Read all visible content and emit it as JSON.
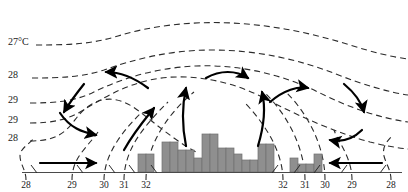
{
  "figure": {
    "type": "meteorological-cross-section",
    "background_color": "#ffffff",
    "isotherm": {
      "color": "#2b2b2b",
      "style": "dashed",
      "dash_pattern": "6 4",
      "width": 1.1
    },
    "arrow_color": "#000000",
    "bar_fill": "#8f8f8f",
    "bar_stroke": "#6f6f6f",
    "baseline_color": "#4a4a4a"
  },
  "left_labels": [
    {
      "text": "27°C",
      "x": 8,
      "y": 45
    },
    {
      "text": "28",
      "x": 8,
      "y": 78
    },
    {
      "text": "29",
      "x": 8,
      "y": 103
    },
    {
      "text": "29",
      "x": 8,
      "y": 123
    },
    {
      "text": "28",
      "x": 8,
      "y": 141
    }
  ],
  "bottom_labels": [
    {
      "text": "28",
      "x": 26
    },
    {
      "text": "29",
      "x": 72
    },
    {
      "text": "30",
      "x": 104
    },
    {
      "text": "31",
      "x": 124
    },
    {
      "text": "32",
      "x": 146
    },
    {
      "text": "32",
      "x": 283
    },
    {
      "text": "31",
      "x": 305
    },
    {
      "text": "30",
      "x": 325
    },
    {
      "text": "29",
      "x": 352
    },
    {
      "text": "28",
      "x": 391
    }
  ],
  "chart_data": {
    "type": "area",
    "title": "",
    "xlabel": "",
    "ylabel": "",
    "series": [
      {
        "name": "isotherm-27C",
        "label": "27°C",
        "path": "M 36,45 C 70,45 92,44 118,36 C 150,26 190,21 232,23 C 272,25 312,33 350,45 C 372,52 392,57 408,59"
      },
      {
        "name": "isotherm-28-upper",
        "label": "28",
        "path": "M 32,78 C 62,78 82,77 104,70 C 132,60 168,50 212,50 C 258,50 300,60 336,74 C 364,85 388,92 408,95"
      },
      {
        "name": "isotherm-29-upper",
        "label": "29",
        "path": "M 30,103 C 56,103 74,101 92,93 C 118,80 152,68 196,66 C 242,64 286,76 320,93 C 350,108 380,118 408,122"
      },
      {
        "name": "isotherm-29-lower",
        "label": "29",
        "path": "M 30,123 C 52,123 66,120 80,112 C 100,100 122,86 150,80 C 186,72 230,80 264,98 C 300,117 340,134 370,142 C 386,146 398,148 408,149"
      },
      {
        "name": "isotherm-28-lower",
        "label": "28",
        "path": "M 30,141 C 48,141 58,137 66,130 C 76,121 78,112 92,104 C 108,95 124,99 140,112 C 156,124 174,140 196,152"
      },
      {
        "name": "isotherm-vertical-28-left",
        "label": "28",
        "path": "M 26,180 C 26,170 20,164 20,156 C 20,148 30,144 34,138"
      },
      {
        "name": "isotherm-vertical-29-left",
        "label": "29",
        "path": "M 72,180 C 72,168 76,160 82,152 C 88,144 94,138 98,132"
      },
      {
        "name": "isotherm-vertical-30-left",
        "label": "30",
        "path": "M 104,180 C 104,166 110,152 118,140 C 126,128 134,120 140,114"
      },
      {
        "name": "isotherm-vertical-31-left",
        "label": "31",
        "path": "M 124,180 C 124,164 130,148 140,134 C 150,120 160,110 168,102"
      },
      {
        "name": "isotherm-vertical-32-left",
        "label": "32",
        "path": "M 146,180 C 146,162 152,144 162,128 C 172,112 184,100 194,92"
      },
      {
        "name": "isotherm-vertical-32-right",
        "label": "32",
        "path": "M 283,180 C 283,166 278,150 270,136 C 262,122 252,110 244,102"
      },
      {
        "name": "isotherm-vertical-31-right",
        "label": "31",
        "path": "M 305,180 C 305,164 300,146 292,130 C 284,114 274,102 266,94"
      },
      {
        "name": "isotherm-vertical-30-right",
        "label": "30",
        "path": "M 325,180 C 325,162 320,144 312,128 C 304,112 294,100 286,92"
      },
      {
        "name": "isotherm-vertical-29-right",
        "label": "29",
        "path": "M 352,180 C 352,168 348,158 344,150 C 340,142 336,136 334,130"
      },
      {
        "name": "isotherm-vertical-28-right",
        "label": "28",
        "path": "M 391,180 C 391,170 386,164 384,156 C 382,148 386,142 392,136"
      }
    ],
    "bars": {
      "baseline_y": 172,
      "unit_width": 8,
      "x_start": 138,
      "heights": [
        18,
        18,
        0,
        30,
        30,
        22,
        22,
        14,
        38,
        38,
        24,
        24,
        18,
        12,
        12,
        28,
        28,
        0,
        0,
        14,
        8,
        8,
        18
      ]
    },
    "arrows": [
      {
        "name": "arrow-inflow-left-low",
        "type": "straight",
        "path": "M 40,163 L 96,163",
        "dir": "right"
      },
      {
        "name": "arrow-divergence-left-mid",
        "type": "curved",
        "path": "M 60,113 C 70,128 82,132 96,135",
        "dir": "right"
      },
      {
        "name": "arrow-subsidence-left",
        "type": "curved",
        "path": "M 84,84 C 76,94 70,102 64,112",
        "dir": "down"
      },
      {
        "name": "arrow-convergence-upper-left",
        "type": "curved",
        "path": "M 148,88 C 132,76 118,72 106,72",
        "dir": "left"
      },
      {
        "name": "arrow-updraft-center-left",
        "type": "curved",
        "path": "M 124,150 C 134,132 146,118 154,108",
        "dir": "up"
      },
      {
        "name": "arrow-updraft-center",
        "type": "curved",
        "path": "M 186,146 C 182,126 182,106 186,88",
        "dir": "up"
      },
      {
        "name": "arrow-outflow-center-right",
        "type": "curved",
        "path": "M 206,78 C 220,70 236,70 248,78",
        "dir": "right"
      },
      {
        "name": "arrow-updraft-right",
        "type": "curved",
        "path": "M 258,146 C 264,126 266,108 262,92",
        "dir": "up"
      },
      {
        "name": "arrow-divergence-upper-right",
        "type": "curved",
        "path": "M 270,102 C 284,90 298,86 308,88",
        "dir": "right"
      },
      {
        "name": "arrow-subsidence-right",
        "type": "curved",
        "path": "M 344,84 C 356,94 362,104 364,112",
        "dir": "down"
      },
      {
        "name": "arrow-return-right-mid",
        "type": "curved",
        "path": "M 362,130 C 352,140 340,142 330,140",
        "dir": "left"
      },
      {
        "name": "arrow-inflow-right-low",
        "type": "straight",
        "path": "M 382,163 L 330,163",
        "dir": "left"
      }
    ]
  }
}
